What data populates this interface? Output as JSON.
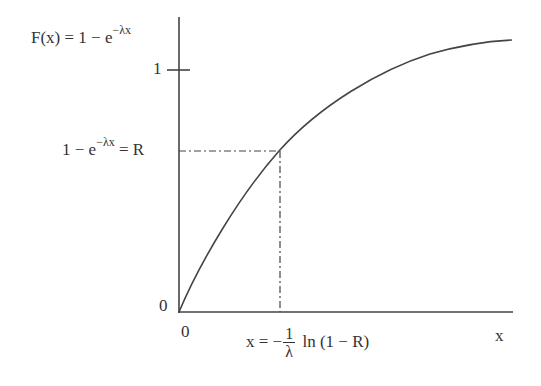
{
  "diagram": {
    "y_axis_label": "F(x) = 1 − e",
    "y_axis_label_exp": "−λx",
    "y_tick_one": "1",
    "y_tick_zero": "0",
    "x_tick_zero": "0",
    "x_axis_label": "x",
    "r_level_label": "1 − e",
    "r_level_exp": "−λx",
    "r_level_suffix": " = R",
    "x_solution_prefix": "x = −",
    "x_solution_num": "1",
    "x_solution_den": "λ",
    "x_solution_suffix": " ln (1 − R)",
    "colors": {
      "line": "#444444",
      "text": "#333333",
      "background": "#ffffff"
    }
  }
}
